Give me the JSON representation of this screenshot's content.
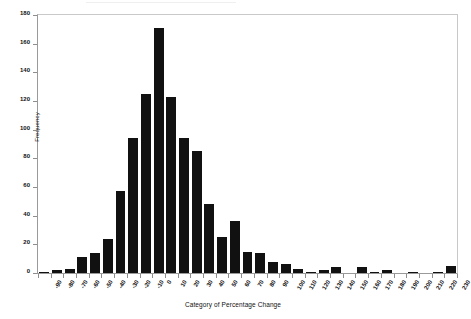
{
  "chart_data": {
    "type": "bar",
    "title": "",
    "subtitle": "",
    "xlabel": "Category of Percentage Change",
    "ylabel": "Frequency",
    "grid": false,
    "legend": null,
    "ylim": [
      0,
      180
    ],
    "yticks": [
      0,
      20,
      40,
      60,
      80,
      100,
      120,
      140,
      160,
      180
    ],
    "ytick_labels": [
      "0",
      "20",
      "40",
      "60",
      "80",
      "100",
      "120",
      "140",
      "160",
      "180"
    ],
    "categories": [
      "-90",
      "-80",
      "-70",
      "-60",
      "-50",
      "-40",
      "-30",
      "-20",
      "-10",
      "0",
      "10",
      "20",
      "30",
      "40",
      "50",
      "60",
      "70",
      "80",
      "90",
      "100",
      "110",
      "120",
      "130",
      "140",
      "150",
      "160",
      "170",
      "180",
      "190",
      "200",
      "210",
      "220",
      "230"
    ],
    "values": [
      1,
      2,
      3,
      11,
      14,
      24,
      57,
      94,
      125,
      171,
      123,
      94,
      85,
      48,
      25,
      36,
      15,
      14,
      8,
      6,
      3,
      1,
      2,
      4,
      0,
      4,
      1,
      2,
      0,
      1,
      0,
      1,
      5
    ],
    "bar_color": "#111111",
    "axis_color": "#8e8e8e",
    "background_color": "#ffffff"
  }
}
